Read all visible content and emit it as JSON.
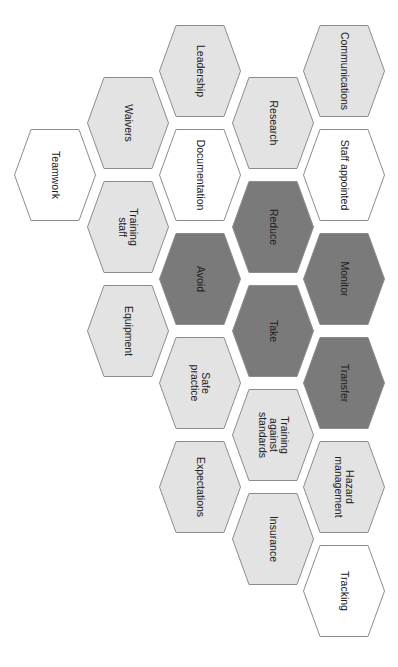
{
  "diagram": {
    "title": "",
    "colors": {
      "dark": "#7a7a7a",
      "light": "#e3e3e3",
      "white": "#ffffff",
      "stroke": "#8c8c8c",
      "text": "#222222"
    },
    "hexagons": [
      {
        "label": "Communications",
        "x": 303,
        "y": 25,
        "fill": "light"
      },
      {
        "label": "Staff appointed",
        "x": 303,
        "y": 129,
        "fill": "white"
      },
      {
        "label": "Monitor",
        "x": 303,
        "y": 233,
        "fill": "dark"
      },
      {
        "label": "Transfer",
        "x": 303,
        "y": 337,
        "fill": "dark"
      },
      {
        "label": "Hazard\nmanagement",
        "x": 303,
        "y": 441,
        "fill": "light"
      },
      {
        "label": "Tracking",
        "x": 303,
        "y": 545,
        "fill": "white"
      },
      {
        "label": "Research",
        "x": 232,
        "y": 77,
        "fill": "light"
      },
      {
        "label": "Reduce",
        "x": 232,
        "y": 181,
        "fill": "dark"
      },
      {
        "label": "Take",
        "x": 232,
        "y": 285,
        "fill": "dark"
      },
      {
        "label": "Training\nagainst\nstandards",
        "x": 232,
        "y": 389,
        "fill": "light"
      },
      {
        "label": "Insurance",
        "x": 232,
        "y": 493,
        "fill": "light"
      },
      {
        "label": "Leadership",
        "x": 159,
        "y": 25,
        "fill": "light"
      },
      {
        "label": "Documentation",
        "x": 159,
        "y": 129,
        "fill": "white"
      },
      {
        "label": "Avoid",
        "x": 159,
        "y": 233,
        "fill": "dark"
      },
      {
        "label": "Safe\npractice",
        "x": 159,
        "y": 337,
        "fill": "light"
      },
      {
        "label": "Expectations",
        "x": 159,
        "y": 441,
        "fill": "light"
      },
      {
        "label": "Waivers",
        "x": 87,
        "y": 77,
        "fill": "light"
      },
      {
        "label": "Training\nstaff",
        "x": 87,
        "y": 181,
        "fill": "light"
      },
      {
        "label": "Equipment",
        "x": 87,
        "y": 285,
        "fill": "light"
      },
      {
        "label": "Teamwork",
        "x": 14,
        "y": 129,
        "fill": "white"
      }
    ]
  }
}
